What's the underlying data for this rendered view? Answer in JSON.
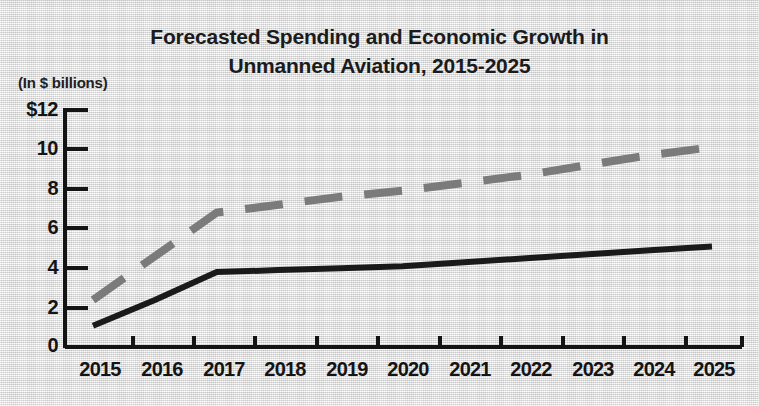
{
  "chart_data": {
    "type": "line",
    "title": "Forecasted Spending and Economic Growth in Unmanned Aviation, 2015-2025",
    "title_line1": "Forecasted Spending and Economic Growth in",
    "title_line2": "Unmanned Aviation, 2015-2025",
    "units_note": "(In $ billions)",
    "xlabel": "",
    "ylabel": "",
    "ylim": [
      0,
      12
    ],
    "ytick_labels": [
      "$12",
      "10",
      "8",
      "6",
      "4",
      "2",
      "0"
    ],
    "ytick_values": [
      12,
      10,
      8,
      6,
      4,
      2,
      0
    ],
    "grid": false,
    "legend": "none",
    "categories": [
      "2015",
      "2016",
      "2017",
      "2018",
      "2019",
      "2020",
      "2021",
      "2022",
      "2023",
      "2024",
      "2025"
    ],
    "x": [
      2015,
      2016,
      2017,
      2018,
      2019,
      2020,
      2021,
      2022,
      2023,
      2024,
      2025
    ],
    "series": [
      {
        "name": "Economic growth (dashed)",
        "style": "dashed",
        "color": "#7b7b7b",
        "values": [
          2.4,
          4.6,
          6.8,
          7.2,
          7.6,
          7.9,
          8.3,
          8.7,
          9.2,
          9.7,
          10.1
        ]
      },
      {
        "name": "Spending (solid)",
        "style": "solid",
        "color": "#1a1a1a",
        "values": [
          1.1,
          2.4,
          3.8,
          3.9,
          4.0,
          4.1,
          4.3,
          4.5,
          4.7,
          4.9,
          5.1
        ]
      }
    ]
  },
  "axes": {
    "x_tick_labels": [
      "2015",
      "2016",
      "2017",
      "2018",
      "2019",
      "2020",
      "2021",
      "2022",
      "2023",
      "2024",
      "2025"
    ],
    "y_tick_labels": [
      "$12",
      "10",
      "8",
      "6",
      "4",
      "2",
      "0"
    ]
  }
}
